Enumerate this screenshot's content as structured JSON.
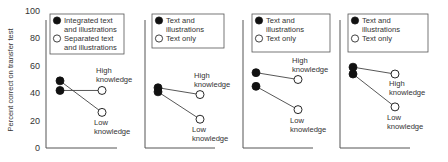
{
  "chart_data": [
    {
      "type": "line",
      "panel": 1,
      "ylabel": "Percent correct on transfer test",
      "ylim": [
        0,
        100
      ],
      "yticks": [
        0,
        20,
        40,
        60,
        80,
        100
      ],
      "legend": [
        "Integrated text and illustrations",
        "Separated text and illustrations"
      ],
      "legend_lines": [
        [
          "Integrated text",
          "and illustrations"
        ],
        [
          "Separated text",
          "and illustrations"
        ]
      ],
      "series": [
        {
          "name": "High knowledge",
          "label_lines": [
            "High",
            "knowledge"
          ],
          "values": [
            42,
            42
          ]
        },
        {
          "name": "Low knowledge",
          "label_lines": [
            "Low",
            "knowledge"
          ],
          "values": [
            49,
            26
          ]
        }
      ]
    },
    {
      "type": "line",
      "panel": 2,
      "ylim": [
        0,
        100
      ],
      "legend": [
        "Text and illustrations",
        "Text only"
      ],
      "legend_lines": [
        [
          "Text and",
          "illustrations"
        ],
        [
          "Text only"
        ]
      ],
      "series": [
        {
          "name": "High knowledge",
          "label_lines": [
            "High",
            "knowledge"
          ],
          "values": [
            44,
            39
          ]
        },
        {
          "name": "Low knowledge",
          "label_lines": [
            "Low",
            "knowledge"
          ],
          "values": [
            41,
            21
          ]
        }
      ]
    },
    {
      "type": "line",
      "panel": 3,
      "ylim": [
        0,
        100
      ],
      "legend": [
        "Text and illustrations",
        "Text only"
      ],
      "legend_lines": [
        [
          "Text and",
          "illustrations"
        ],
        [
          "Text only"
        ]
      ],
      "series": [
        {
          "name": "High knowledge",
          "label_lines": [
            "High",
            "knowledge"
          ],
          "values": [
            55,
            50
          ]
        },
        {
          "name": "Low knowledge",
          "label_lines": [
            "Low",
            "knowledge"
          ],
          "values": [
            45,
            28
          ]
        }
      ]
    },
    {
      "type": "line",
      "panel": 4,
      "ylim": [
        0,
        100
      ],
      "legend": [
        "Text and illustrations",
        "Text only"
      ],
      "legend_lines": [
        [
          "Text and",
          "illustrations"
        ],
        [
          "Text only"
        ]
      ],
      "series": [
        {
          "name": "High knowledge",
          "label_lines": [
            "High",
            "knowledge"
          ],
          "values": [
            59,
            54
          ]
        },
        {
          "name": "Low knowledge",
          "label_lines": [
            "Low",
            "knowledge"
          ],
          "values": [
            54,
            30
          ]
        }
      ]
    }
  ],
  "colors": {
    "axis": "#555555",
    "line": "#444444",
    "filled_marker": "#111111",
    "open_marker_fill": "#ffffff",
    "text": "#333333"
  }
}
